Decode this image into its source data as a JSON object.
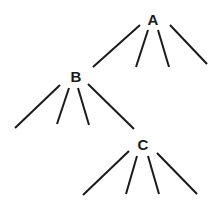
{
  "diagram": {
    "type": "tree",
    "nodes": [
      {
        "id": "A",
        "label": "A",
        "x": 153,
        "y": 25
      },
      {
        "id": "B",
        "label": "B",
        "x": 76,
        "y": 82
      },
      {
        "id": "C",
        "label": "C",
        "x": 143,
        "y": 150
      }
    ],
    "edges": [
      {
        "from": "A",
        "x1": 140,
        "y1": 25,
        "x2": 93,
        "y2": 67,
        "to": "B"
      },
      {
        "from": "A",
        "x1": 148,
        "y1": 30,
        "x2": 136,
        "y2": 67
      },
      {
        "from": "A",
        "x1": 158,
        "y1": 30,
        "x2": 169,
        "y2": 67
      },
      {
        "from": "A",
        "x1": 170,
        "y1": 25,
        "x2": 207,
        "y2": 64
      },
      {
        "from": "B",
        "x1": 60,
        "y1": 85,
        "x2": 15,
        "y2": 128
      },
      {
        "from": "B",
        "x1": 69,
        "y1": 88,
        "x2": 57,
        "y2": 124
      },
      {
        "from": "B",
        "x1": 78,
        "y1": 88,
        "x2": 89,
        "y2": 125
      },
      {
        "from": "B",
        "x1": 88,
        "y1": 84,
        "x2": 134,
        "y2": 129,
        "to": "C"
      },
      {
        "from": "C",
        "x1": 129,
        "y1": 151,
        "x2": 83,
        "y2": 195
      },
      {
        "from": "C",
        "x1": 137,
        "y1": 156,
        "x2": 126,
        "y2": 194
      },
      {
        "from": "C",
        "x1": 148,
        "y1": 156,
        "x2": 159,
        "y2": 194
      },
      {
        "from": "C",
        "x1": 157,
        "y1": 153,
        "x2": 197,
        "y2": 194
      }
    ]
  }
}
